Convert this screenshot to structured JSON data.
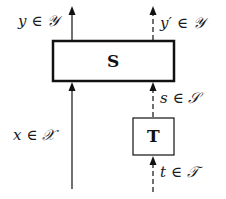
{
  "diagram": {
    "boxes": [
      {
        "id": "S",
        "label": "S"
      },
      {
        "id": "T",
        "label": "T"
      }
    ],
    "labels": {
      "y_out": "y ∈ 𝒴",
      "y_prime_out": "y′ ∈ 𝒴",
      "x_in": "x ∈ 𝒳",
      "s_in": "s ∈ 𝒮",
      "t_in": "t ∈ 𝒯"
    },
    "edges": [
      {
        "from": "x",
        "to": "S",
        "style": "solid"
      },
      {
        "from": "S",
        "to": "y",
        "style": "solid"
      },
      {
        "from": "t",
        "to": "T",
        "style": "dashed"
      },
      {
        "from": "T",
        "to": "S",
        "label": "s",
        "style": "dashed"
      },
      {
        "from": "S",
        "to": "y'",
        "style": "dashed"
      }
    ]
  }
}
